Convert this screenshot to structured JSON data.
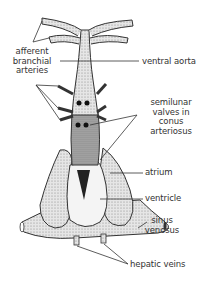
{
  "diagram": {
    "colors": {
      "background": "#ffffff",
      "line": "#333333",
      "text": "#333333",
      "stipple_light": "#d9d9d9",
      "stipple_dark": "#8a8a8a",
      "dark_fill": "#222222"
    },
    "labels": {
      "afferent_branchial_arteries": [
        "afferent",
        "branchial",
        "arteries"
      ],
      "ventral_aorta": "ventral aorta",
      "semilunar_valves": [
        "semilunar",
        "valves in",
        "conus",
        "arteriosus"
      ],
      "atrium": "atrium",
      "ventricle": "ventricle",
      "sinus_venosus": [
        "sinus",
        "venosus"
      ],
      "hepatic_veins": "hepatic veins"
    }
  }
}
